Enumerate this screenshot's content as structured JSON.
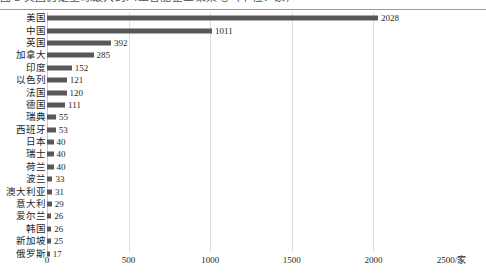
{
  "caption": {
    "text": "图 2  美国仍是全球最大的人工智能企业聚集地（单位：家）"
  },
  "chart_data": {
    "type": "bar",
    "orientation": "horizontal",
    "title": "",
    "xlabel": "2500/家",
    "ylabel": "",
    "xlim": [
      0,
      2500
    ],
    "xticks": [
      0,
      500,
      1000,
      1500,
      2000,
      2500
    ],
    "xtick_labels": [
      "0",
      "500",
      "1000",
      "1500",
      "2000",
      "2500/家"
    ],
    "grid": true,
    "legend": false,
    "bar_color": "#585858",
    "categories": [
      "美国",
      "中国",
      "英国",
      "加拿大",
      "印度",
      "以色列",
      "法国",
      "德国",
      "瑞典",
      "西班牙",
      "日本",
      "瑞士",
      "荷兰",
      "波兰",
      "澳大利亚",
      "意大利",
      "爱尔兰",
      "韩国",
      "新加坡",
      "俄罗斯"
    ],
    "values": [
      2028,
      1011,
      392,
      285,
      152,
      121,
      120,
      111,
      55,
      53,
      40,
      40,
      40,
      33,
      31,
      29,
      26,
      26,
      25,
      17
    ],
    "value_labels": [
      "2028",
      "1011",
      "392",
      "285",
      "152",
      "121",
      "120",
      "111",
      "55",
      "53",
      "40",
      "40",
      "40",
      "33",
      "31",
      "29",
      "26",
      "26",
      "25",
      "17"
    ]
  },
  "axis_geometry": {
    "x0_px": 47,
    "px_per_unit": 0.1632
  }
}
